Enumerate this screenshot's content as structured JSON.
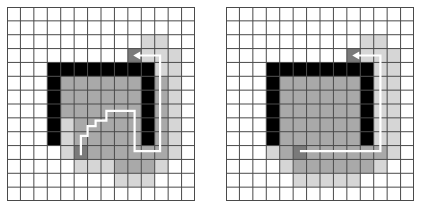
{
  "figure": {
    "type": "pathfinding-grid-comparison",
    "grid_size": {
      "cols": 14,
      "rows": 14
    },
    "legend": {
      "0": {
        "name": "free",
        "color": "#ffffff"
      },
      "1": {
        "name": "explored-light",
        "color": "#d6d6d6"
      },
      "2": {
        "name": "explored-medium",
        "color": "#a9a9a9"
      },
      "3": {
        "name": "start-goal",
        "color": "#7a7a7a"
      },
      "4": {
        "name": "wall",
        "color": "#000000"
      }
    },
    "grid_line_color": "#4a4a4a",
    "path_color": "#ffffff"
  },
  "panels": [
    {
      "id": "left",
      "cells": [
        [
          0,
          0,
          0,
          0,
          0,
          0,
          0,
          0,
          0,
          0,
          0,
          0,
          0,
          0
        ],
        [
          0,
          0,
          0,
          0,
          0,
          0,
          0,
          0,
          0,
          0,
          0,
          0,
          0,
          0
        ],
        [
          0,
          0,
          0,
          0,
          0,
          0,
          0,
          0,
          0,
          0,
          1,
          1,
          0,
          0
        ],
        [
          0,
          0,
          0,
          0,
          0,
          0,
          0,
          0,
          0,
          3,
          1,
          1,
          1,
          0
        ],
        [
          0,
          0,
          0,
          4,
          4,
          4,
          4,
          4,
          4,
          4,
          4,
          1,
          1,
          0
        ],
        [
          0,
          0,
          0,
          4,
          2,
          2,
          2,
          2,
          2,
          2,
          4,
          2,
          1,
          0
        ],
        [
          0,
          0,
          0,
          4,
          2,
          2,
          2,
          2,
          2,
          2,
          4,
          2,
          1,
          0
        ],
        [
          0,
          0,
          0,
          4,
          2,
          2,
          2,
          2,
          2,
          2,
          4,
          2,
          1,
          0
        ],
        [
          0,
          0,
          0,
          4,
          1,
          2,
          2,
          2,
          2,
          2,
          4,
          2,
          1,
          0
        ],
        [
          0,
          0,
          0,
          4,
          1,
          2,
          2,
          2,
          2,
          2,
          4,
          2,
          1,
          0
        ],
        [
          0,
          0,
          0,
          0,
          1,
          3,
          2,
          2,
          2,
          2,
          2,
          2,
          1,
          0
        ],
        [
          0,
          0,
          0,
          0,
          0,
          1,
          1,
          1,
          2,
          2,
          2,
          1,
          0,
          0
        ],
        [
          0,
          0,
          0,
          0,
          0,
          0,
          0,
          0,
          1,
          1,
          1,
          0,
          0,
          0
        ],
        [
          0,
          0,
          0,
          0,
          0,
          0,
          0,
          0,
          0,
          0,
          0,
          0,
          0,
          0
        ]
      ],
      "path": {
        "description": "staircase path from start around wall to goal",
        "points": [
          [
            5.5,
            10.7
          ],
          [
            5.5,
            9.3
          ],
          [
            6.0,
            9.3
          ],
          [
            6.0,
            8.6
          ],
          [
            6.6,
            8.6
          ],
          [
            6.6,
            8.2
          ],
          [
            7.4,
            8.2
          ],
          [
            7.4,
            7.5
          ],
          [
            9.5,
            7.5
          ],
          [
            9.5,
            10.4
          ],
          [
            11.4,
            10.4
          ],
          [
            11.4,
            3.5
          ],
          [
            9.7,
            3.5
          ]
        ],
        "arrow": "left"
      }
    },
    {
      "id": "right",
      "cells": [
        [
          0,
          0,
          0,
          0,
          0,
          0,
          0,
          0,
          0,
          0,
          0,
          0,
          0,
          0
        ],
        [
          0,
          0,
          0,
          0,
          0,
          0,
          0,
          0,
          0,
          0,
          0,
          0,
          0,
          0
        ],
        [
          0,
          0,
          0,
          0,
          0,
          0,
          0,
          0,
          0,
          0,
          1,
          1,
          0,
          0
        ],
        [
          0,
          0,
          0,
          0,
          0,
          0,
          0,
          0,
          0,
          3,
          1,
          1,
          1,
          0
        ],
        [
          0,
          0,
          0,
          4,
          4,
          4,
          4,
          4,
          4,
          4,
          4,
          1,
          1,
          0
        ],
        [
          0,
          0,
          0,
          4,
          2,
          2,
          2,
          2,
          2,
          2,
          4,
          1,
          1,
          0
        ],
        [
          0,
          0,
          0,
          4,
          2,
          2,
          2,
          2,
          2,
          2,
          4,
          1,
          1,
          0
        ],
        [
          0,
          0,
          0,
          4,
          2,
          2,
          2,
          2,
          2,
          2,
          4,
          1,
          1,
          0
        ],
        [
          0,
          0,
          0,
          4,
          2,
          2,
          2,
          2,
          2,
          2,
          4,
          1,
          1,
          0
        ],
        [
          0,
          0,
          0,
          4,
          2,
          2,
          2,
          2,
          2,
          2,
          4,
          1,
          1,
          0
        ],
        [
          0,
          0,
          0,
          1,
          2,
          3,
          2,
          2,
          2,
          2,
          2,
          2,
          1,
          0
        ],
        [
          0,
          0,
          0,
          0,
          1,
          2,
          2,
          2,
          2,
          2,
          2,
          1,
          0,
          0
        ],
        [
          0,
          0,
          0,
          0,
          0,
          1,
          1,
          1,
          1,
          1,
          0,
          0,
          0,
          0
        ],
        [
          0,
          0,
          0,
          0,
          0,
          0,
          0,
          0,
          0,
          0,
          0,
          0,
          0,
          0
        ]
      ],
      "path": {
        "description": "straight path from start right then up to goal",
        "points": [
          [
            5.5,
            10.4
          ],
          [
            11.5,
            10.4
          ],
          [
            11.5,
            3.5
          ],
          [
            9.7,
            3.5
          ]
        ],
        "arrow": "left"
      }
    }
  ]
}
